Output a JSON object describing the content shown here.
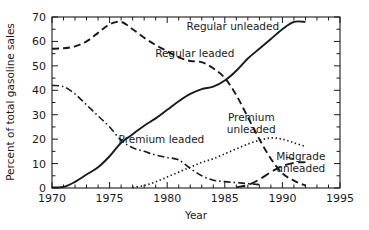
{
  "chart_data": {
    "type": "line",
    "title": "",
    "xlabel": "Year",
    "ylabel": "Percent of total gasoline sales",
    "xlim": [
      1970,
      1995
    ],
    "ylim": [
      0,
      70
    ],
    "xticks": [
      1970,
      1975,
      1980,
      1985,
      1990,
      1995
    ],
    "xticklabels": [
      "1970",
      "1975",
      "1980",
      "1985",
      "1990",
      "1995"
    ],
    "yticks": [
      0,
      10,
      20,
      30,
      40,
      50,
      60,
      70
    ],
    "yticklabels": [
      "0",
      "10",
      "20",
      "30",
      "40",
      "50",
      "60",
      "70"
    ],
    "x_minor_tick_step": 1,
    "y_minor_tick_step": 5,
    "grid": false,
    "legend_position": "inline-annotations",
    "frame": "box",
    "series": [
      {
        "name": "Regular leaded",
        "style": "dashed",
        "label_text": "Regular leaded",
        "label_x": 1982.4,
        "label_y": 53.5,
        "x": [
          1970,
          1971,
          1972,
          1973,
          1974,
          1975,
          1976,
          1977,
          1978,
          1979,
          1980,
          1981,
          1982,
          1983,
          1984,
          1985,
          1986,
          1987,
          1988,
          1989,
          1990,
          1991,
          1992
        ],
        "y": [
          57,
          57.2,
          58,
          60,
          63.5,
          67,
          68,
          65,
          61.5,
          58.5,
          56,
          53.5,
          52,
          51.5,
          49,
          45,
          38,
          29,
          20,
          12,
          6,
          3,
          1
        ]
      },
      {
        "name": "Regular unleaded",
        "style": "solid",
        "label_text": "Regular unleaded",
        "label_x": 1985.7,
        "label_y": 64.5,
        "x": [
          1970,
          1971,
          1972,
          1973,
          1974,
          1975,
          1976,
          1977,
          1978,
          1979,
          1980,
          1981,
          1982,
          1983,
          1984,
          1985,
          1986,
          1987,
          1988,
          1989,
          1990,
          1991,
          1992
        ],
        "y": [
          0.3,
          0.4,
          2.5,
          5.5,
          8.5,
          13,
          18.5,
          22,
          25.5,
          28.5,
          32,
          35.5,
          38.5,
          40.5,
          41.5,
          44,
          48,
          53,
          57,
          61,
          65,
          68,
          68
        ]
      },
      {
        "name": "Premium leaded",
        "style": "dashdot",
        "label_text": "Premium leaded",
        "label_x": 1979.5,
        "label_y": 18.5,
        "x": [
          1970,
          1971,
          1972,
          1973,
          1974,
          1975,
          1976,
          1977,
          1978,
          1979,
          1980,
          1981,
          1982,
          1983,
          1984,
          1985,
          1986,
          1987,
          1988
        ],
        "y": [
          42,
          41.5,
          38.5,
          34,
          29.5,
          25,
          19.5,
          16.5,
          15,
          13.5,
          12.5,
          11.5,
          8,
          5,
          3.2,
          2.6,
          2.2,
          1.8,
          1.4
        ]
      },
      {
        "name": "Premium unleaded",
        "style": "dotted",
        "label_text_line1": "Premium",
        "label_text_line2": "unleaded",
        "label_x": 1987.3,
        "label_y": 27.5,
        "x": [
          1977,
          1978,
          1979,
          1980,
          1981,
          1982,
          1983,
          1984,
          1985,
          1986,
          1987,
          1988,
          1989,
          1990,
          1991,
          1992
        ],
        "y": [
          0.2,
          1.0,
          2.5,
          4.5,
          6.5,
          8.5,
          10.5,
          12,
          14,
          16,
          18,
          19.5,
          20.5,
          20,
          18.5,
          17
        ]
      },
      {
        "name": "Midgrade unleaded",
        "style": "longdash",
        "label_text_line1": "Midgrade",
        "label_text_line2": "unleaded",
        "label_x": 1991.6,
        "label_y": 11.5,
        "x": [
          1986,
          1987,
          1988,
          1989,
          1990,
          1991,
          1992
        ],
        "y": [
          0.3,
          1.2,
          3.5,
          6.5,
          9.0,
          10.3,
          10.6
        ]
      }
    ]
  },
  "axis": {
    "y_title": "Percent of total gasoline sales",
    "x_title": "Year"
  }
}
